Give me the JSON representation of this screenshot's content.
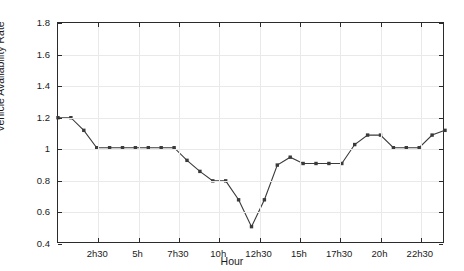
{
  "chart_data": {
    "type": "line",
    "title": "",
    "xlabel": "Hour",
    "ylabel": "Vehicle Availability Rate",
    "xlim": [
      0,
      24
    ],
    "ylim": [
      0.4,
      1.8
    ],
    "yticks": [
      0.4,
      0.6,
      0.8,
      1.0,
      1.2,
      1.4,
      1.6,
      1.8
    ],
    "ytick_labels": [
      "0.4",
      "0.6",
      "0.8",
      "1",
      "1.2",
      "1.4",
      "1.6",
      "1.8"
    ],
    "xticks": [
      2.5,
      5,
      7.5,
      10,
      12.5,
      15,
      17.5,
      20,
      22.5
    ],
    "xtick_labels": [
      "2h30",
      "5h",
      "7h30",
      "10h",
      "12h30",
      "15h",
      "17h30",
      "20h",
      "22h30"
    ],
    "grid": true,
    "legend": null,
    "marker": "square",
    "marker_color": "#3a3a3a",
    "line_color": "#3a3a3a",
    "x": [
      0,
      0.8,
      1.6,
      2.4,
      3.2,
      4.0,
      4.8,
      5.6,
      6.4,
      7.2,
      8.0,
      8.8,
      9.6,
      10.4,
      11.2,
      12.0,
      12.8,
      13.6,
      14.4,
      15.2,
      16.0,
      16.8,
      17.6,
      18.4,
      19.2,
      20.0,
      20.8,
      21.6,
      22.4,
      23.2,
      24.0
    ],
    "series": [
      {
        "name": "Vehicle Availability Rate",
        "values": [
          1.2,
          1.2,
          1.12,
          1.01,
          1.01,
          1.01,
          1.01,
          1.01,
          1.01,
          1.01,
          0.93,
          0.86,
          0.8,
          0.8,
          0.68,
          0.51,
          0.68,
          0.9,
          0.95,
          0.91,
          0.91,
          0.91,
          0.91,
          1.03,
          1.09,
          1.09,
          1.01,
          1.01,
          1.01,
          1.09,
          1.12
        ]
      }
    ]
  },
  "chart_data_full": {
    "points_x": [
      0,
      0.8,
      1.6,
      2.4,
      3.2,
      4.0,
      4.8,
      5.6,
      6.4,
      7.2,
      8.0,
      8.8,
      9.6,
      10.4,
      11.2,
      12.0
    ],
    "note": "values sampled at ~30 minute intervals"
  },
  "axis": {
    "y_title": "Vehicle Availability Rate",
    "x_title": "Hour"
  }
}
